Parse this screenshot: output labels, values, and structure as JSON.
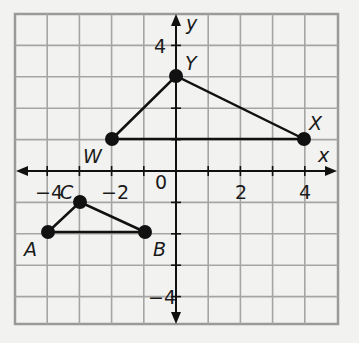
{
  "graph": {
    "axes": {
      "x_label": "x",
      "y_label": "y",
      "x_range": [
        -5,
        5
      ],
      "y_range": [
        -5,
        5
      ],
      "grid_unit": 1,
      "x_ticks": [
        {
          "value": -4,
          "label": "−4"
        },
        {
          "value": -2,
          "label": "−2"
        },
        {
          "value": 2,
          "label": "2"
        },
        {
          "value": 4,
          "label": "4"
        }
      ],
      "y_ticks": [
        {
          "value": 4,
          "label": "4"
        },
        {
          "value": -4,
          "label": "−4"
        }
      ],
      "origin_label": "0"
    },
    "triangles": [
      {
        "name": "WYX",
        "points": [
          {
            "label": "W",
            "x": -2,
            "y": 1
          },
          {
            "label": "Y",
            "x": 0,
            "y": 3
          },
          {
            "label": "X",
            "x": 4,
            "y": 1
          }
        ]
      },
      {
        "name": "ACB",
        "points": [
          {
            "label": "A",
            "x": -4,
            "y": -2
          },
          {
            "label": "C",
            "x": -3,
            "y": -1
          },
          {
            "label": "B",
            "x": -1,
            "y": -2
          }
        ]
      }
    ],
    "colors": {
      "background": "#f2f2f0",
      "grid": "#9a9a9a",
      "ink": "#111111"
    }
  }
}
